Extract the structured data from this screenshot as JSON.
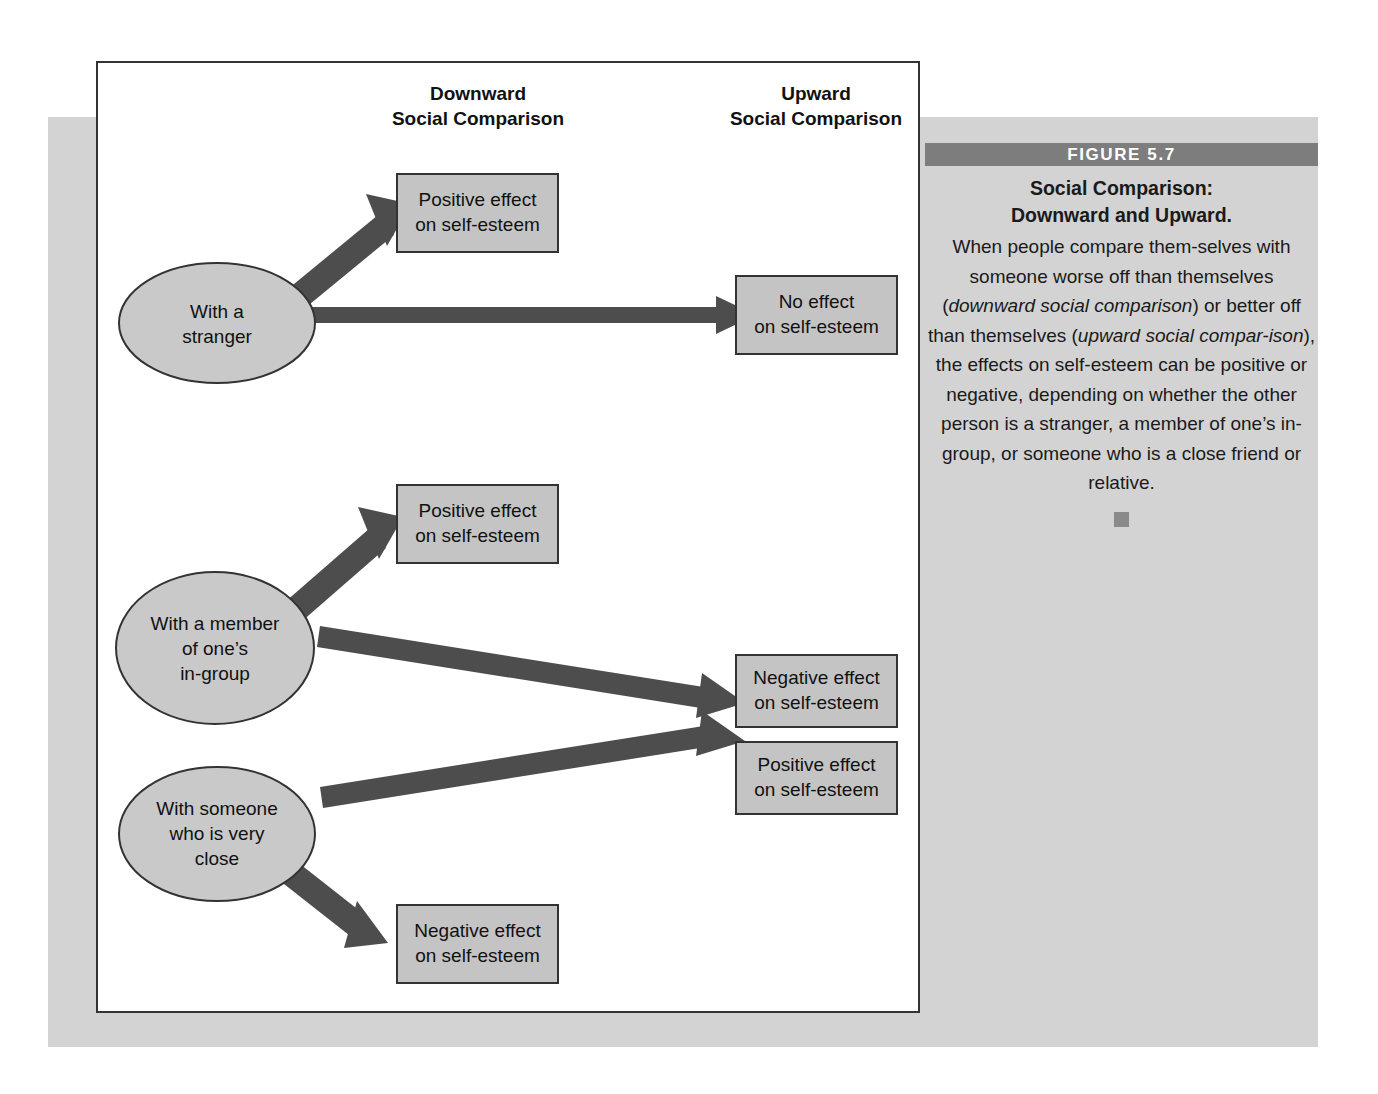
{
  "figure": {
    "bar_label": "FIGURE 5.7",
    "title": "Social Comparison:\nDownward and Upward.",
    "caption_parts": {
      "p1": "When people compare them-selves with someone worse off than themselves (",
      "em1": "downward social comparison",
      "p2": ") or better off than themselves (",
      "em2": "upward social compar-ison",
      "p3": "), the effects on self-esteem can be positive or negative, depending on whether the other person is a stranger, a member of one’s in-group, or someone who is a close friend or relative."
    },
    "caption_full": "When people compare themselves with someone worse off than themselves (downward social comparison) or better off than themselves (upward social comparison), the effects on self-esteem can be positive or negative, depending on whether the other person is a stranger, a member of one’s in-group, or someone who is a close friend or relative."
  },
  "columns": {
    "downward": "Downward\nSocial Comparison",
    "upward": "Upward\nSocial Comparison"
  },
  "nodes": [
    {
      "id": "stranger",
      "label": "With a\nstranger"
    },
    {
      "id": "in-group",
      "label": "With a member\nof one’s\nin-group"
    },
    {
      "id": "close",
      "label": "With someone\nwho is very\nclose"
    }
  ],
  "outcomes": [
    {
      "id": "stranger-downward",
      "label": "Positive effect\non self-esteem",
      "column": "downward"
    },
    {
      "id": "stranger-upward",
      "label": "No effect\non self-esteem",
      "column": "upward"
    },
    {
      "id": "ingroup-downward",
      "label": "Positive effect\non self-esteem",
      "column": "downward"
    },
    {
      "id": "ingroup-upward",
      "label": "Negative effect\non self-esteem",
      "column": "upward"
    },
    {
      "id": "close-upward",
      "label": "Positive effect\non self-esteem",
      "column": "upward"
    },
    {
      "id": "close-downward",
      "label": "Negative effect\non self-esteem",
      "column": "downward"
    }
  ],
  "colors": {
    "node_fill": "#c9c9c9",
    "box_fill": "#c4c4c4",
    "arrow": "#4d4d4d",
    "panel_bg": "#d3d3d3",
    "figure_bar": "#7d7d7d",
    "stroke": "#333333"
  }
}
